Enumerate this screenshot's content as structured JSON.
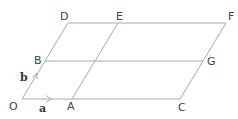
{
  "diagram": {
    "type": "vector-grid-parallelogram",
    "points": {
      "O": "O",
      "A": "A",
      "C": "C",
      "B": "B",
      "G": "G",
      "D": "D",
      "E": "E",
      "F": "F"
    },
    "vectors": {
      "a": "a",
      "b": "b"
    },
    "segments": [
      "OC",
      "BG",
      "DF",
      "OD",
      "AE",
      "CF"
    ],
    "line_color": "#a9a9a9",
    "label_color": "#444444"
  }
}
